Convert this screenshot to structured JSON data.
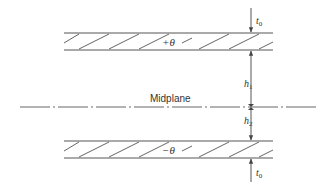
{
  "diagram": {
    "type": "laminate-cross-section",
    "colors": {
      "line": "#555555",
      "text": "#333333",
      "background": "#ffffff"
    },
    "midplane": {
      "label": "Midplane",
      "style": "dash-dot"
    },
    "layers": [
      {
        "name": "top-ply",
        "angle_label": "+θ"
      },
      {
        "name": "bottom-ply",
        "angle_label": "−θ"
      }
    ],
    "dimensions": {
      "top_thickness": {
        "label_main": "t",
        "label_sub": "0"
      },
      "h1": {
        "label_main": "h",
        "label_sub": "1"
      },
      "h2": {
        "label_main": "h",
        "label_sub": "2"
      },
      "bottom_thickness": {
        "label_main": "t",
        "label_sub": "0"
      }
    }
  }
}
